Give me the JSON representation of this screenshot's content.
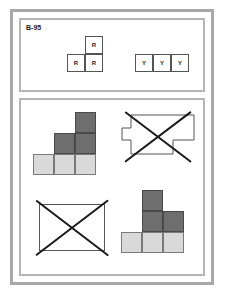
{
  "card": {
    "label": "B-95",
    "border_color": "#a8a8a8",
    "panel_border_color": "#b4b4b4",
    "background": "#ffffff"
  },
  "colors": {
    "light_fill": "#d9d9d9",
    "dark_fill": "#6e6e6e",
    "white_fill": "#ffffff",
    "cell_stroke": "#555555",
    "x_stroke": "#1a1a1a"
  },
  "prompt": {
    "pieces": [
      {
        "name": "r-tromino",
        "letter": "R",
        "cells": [
          {
            "col": 1,
            "row": 0
          },
          {
            "col": 0,
            "row": 1
          },
          {
            "col": 1,
            "row": 1
          }
        ]
      },
      {
        "name": "y-tromino",
        "letter": "Y",
        "cells": [
          {
            "col": 0,
            "row": 0
          },
          {
            "col": 1,
            "row": 0
          },
          {
            "col": 2,
            "row": 0
          }
        ]
      }
    ]
  },
  "answers": [
    {
      "name": "answer-staircase-ascending",
      "crossed_out": false,
      "cells": [
        {
          "col": 0,
          "row": 2,
          "fill": "light"
        },
        {
          "col": 1,
          "row": 2,
          "fill": "light"
        },
        {
          "col": 2,
          "row": 2,
          "fill": "light"
        },
        {
          "col": 1,
          "row": 1,
          "fill": "dark"
        },
        {
          "col": 2,
          "row": 1,
          "fill": "dark"
        },
        {
          "col": 2,
          "row": 0,
          "fill": "dark"
        }
      ]
    },
    {
      "name": "answer-irregular-outline",
      "crossed_out": true,
      "outline": true
    },
    {
      "name": "answer-plain-rectangle",
      "crossed_out": true,
      "rectangle": true
    },
    {
      "name": "answer-staircase-center",
      "crossed_out": false,
      "cells": [
        {
          "col": 0,
          "row": 2,
          "fill": "light"
        },
        {
          "col": 1,
          "row": 2,
          "fill": "light"
        },
        {
          "col": 2,
          "row": 2,
          "fill": "light"
        },
        {
          "col": 1,
          "row": 1,
          "fill": "dark"
        },
        {
          "col": 2,
          "row": 1,
          "fill": "dark"
        },
        {
          "col": 1,
          "row": 0,
          "fill": "dark"
        }
      ]
    }
  ]
}
